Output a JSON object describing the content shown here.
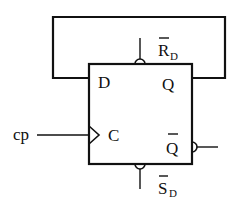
{
  "diagram": {
    "type": "D flip-flop with feedback",
    "block": {
      "inputs": {
        "d": "D",
        "clock": "C"
      },
      "outputs": {
        "q": "Q",
        "q_bar": "Q",
        "q_bar_overbar": true
      }
    },
    "external": {
      "clock_signal": "cp",
      "reset": {
        "main": "R",
        "sub": "D",
        "overbar": true
      },
      "set": {
        "main": "S",
        "sub": "D",
        "overbar": true
      }
    },
    "feedback": "Q connected back to D",
    "colors": {
      "line": "#111111",
      "background": "#ffffff"
    }
  }
}
